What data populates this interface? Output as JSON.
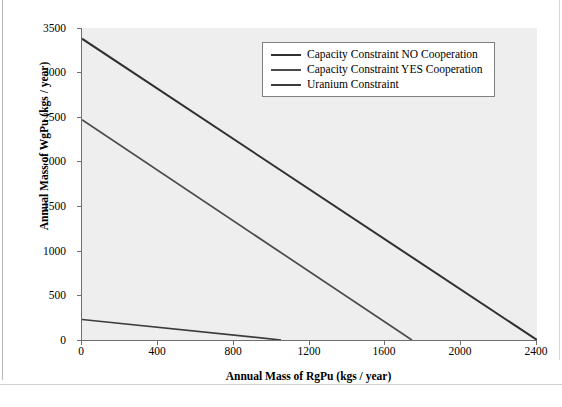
{
  "chart_data": {
    "type": "line",
    "title": "",
    "xlabel": "Annual Mass of RgPu (kgs / year)",
    "ylabel": "Annual Mass of WgPu (kgs / year)",
    "xlim": [
      0,
      2400
    ],
    "ylim": [
      0,
      3500
    ],
    "xticks": [
      0,
      400,
      800,
      1200,
      1600,
      2000,
      2400
    ],
    "yticks": [
      0,
      500,
      1000,
      1500,
      2000,
      2500,
      3000,
      3500
    ],
    "xtick_labels": [
      "0",
      "400",
      "800",
      "1200",
      "1600",
      "2000",
      "2400"
    ],
    "ytick_labels": [
      "0",
      "500",
      "1000",
      "1500",
      "2000",
      "2500",
      "3000",
      "3500"
    ],
    "grid": false,
    "legend_position": "upper right",
    "plot_background": "#eeeeee",
    "series": [
      {
        "name": "Capacity Constraint NO Cooperation",
        "color": "#303030",
        "x": [
          0,
          2400
        ],
        "y": [
          3380,
          0
        ]
      },
      {
        "name": "Capacity Constraint YES Cooperation",
        "color": "#4a4a4a",
        "x": [
          0,
          1740
        ],
        "y": [
          2470,
          0
        ]
      },
      {
        "name": "Uranium Constraint",
        "color": "#3c3c3c",
        "x": [
          0,
          1050
        ],
        "y": [
          230,
          0
        ]
      }
    ]
  },
  "legend": {
    "entries": [
      {
        "label": "Capacity Constraint NO Cooperation",
        "color": "#303030"
      },
      {
        "label": "Capacity Constraint YES Cooperation",
        "color": "#4a4a4a"
      },
      {
        "label": "Uranium Constraint",
        "color": "#3c3c3c"
      }
    ]
  },
  "axes": {
    "x_title": "Annual Mass of RgPu (kgs / year)",
    "y_title": "Annual Mass of WgPu (kgs / year)"
  }
}
